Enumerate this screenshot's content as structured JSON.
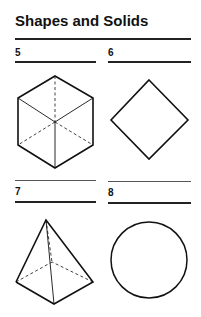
{
  "page": {
    "title": "Shapes and Solids",
    "items": [
      {
        "number": "5",
        "shape": "cube"
      },
      {
        "number": "6",
        "shape": "square (diamond)"
      },
      {
        "number": "7",
        "shape": "square pyramid"
      },
      {
        "number": "8",
        "shape": "circle"
      }
    ]
  }
}
